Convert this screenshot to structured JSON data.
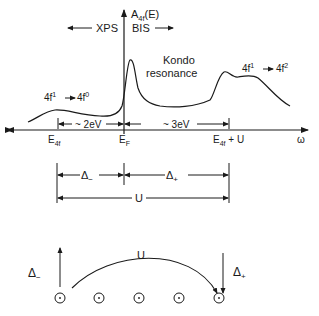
{
  "spectrum": {
    "y_axis_label": "A",
    "y_axis_sub": "4f",
    "y_axis_tail": "(E)",
    "x_axis_label": "ω",
    "xps_label": "XPS",
    "bis_label": "BIS",
    "kondo_line1": "Kondo",
    "kondo_line2": "resonance",
    "left_transition": {
      "from_base": "4f",
      "from_sup": "1",
      "to_base": "4f",
      "to_sup": "0"
    },
    "right_transition": {
      "from_base": "4f",
      "from_sup": "1",
      "to_base": "4f",
      "to_sup": "2"
    },
    "gap_left": "~ 2eV",
    "gap_right": "~ 3eV",
    "tick_e4f_base": "E",
    "tick_e4f_sub": "4f",
    "tick_ef_base": "E",
    "tick_ef_sub": "F",
    "tick_e4fu_base": "E",
    "tick_e4fu_sub": "4f",
    "tick_e4fu_tail": " + U"
  },
  "energy_bar": {
    "delta_minus_base": "Δ",
    "delta_minus_sub": "−",
    "delta_plus_base": "Δ",
    "delta_plus_sub": "+",
    "u_label": "U"
  },
  "lattice": {
    "delta_minus_base": "Δ",
    "delta_minus_sub": "−",
    "delta_plus_base": "Δ",
    "delta_plus_sub": "+",
    "u_label": "U",
    "site_count": 5
  }
}
